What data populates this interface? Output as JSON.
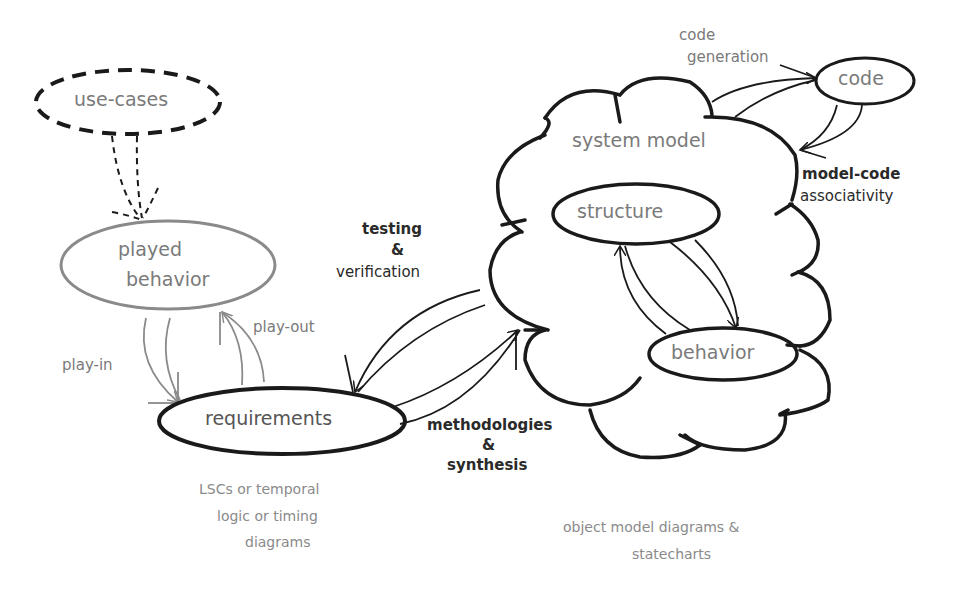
{
  "nodes": {
    "use_cases": "use-cases",
    "played_behavior_line1": "played",
    "played_behavior_line2": "behavior",
    "requirements": "requirements",
    "system_model": "system model",
    "structure": "structure",
    "behavior": "behavior",
    "code": "code"
  },
  "edges": {
    "play_in": "play-in",
    "play_out": "play-out",
    "testing_line1": "testing",
    "testing_line2": "&",
    "testing_line3": "verification",
    "methodologies_line1": "methodologies",
    "methodologies_line2": "&",
    "methodologies_line3": "synthesis",
    "code_generation_line1": "code",
    "code_generation_line2": "generation",
    "model_code_line1": "model-code",
    "model_code_line2": "associativity"
  },
  "notes": {
    "requirements_note_line1": "LSCs or temporal",
    "requirements_note_line2": "logic or timing",
    "requirements_note_line3": "diagrams",
    "model_note_line1": "object model diagrams &",
    "model_note_line2": "statecharts"
  },
  "colors": {
    "stroke_dark": "#1a1a1a",
    "stroke_gray": "#8a8a8a",
    "text_gray": "#7a7a7a"
  }
}
